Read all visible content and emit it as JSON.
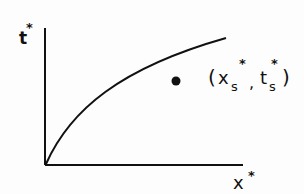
{
  "diagram": {
    "y_axis_label": "t",
    "y_axis_superscript": "*",
    "x_axis_label": "x",
    "x_axis_superscript": "*",
    "curve": "monotonically increasing concave curve from origin",
    "point_label": {
      "open": "(",
      "x": "x",
      "x_sub": "s",
      "x_sup": "*",
      "sep": ",",
      "t": "t",
      "t_sub": "s",
      "t_sup": "*",
      "close": ")"
    },
    "colors": {
      "ink": "#111111",
      "background": "#fdfdfd"
    }
  }
}
